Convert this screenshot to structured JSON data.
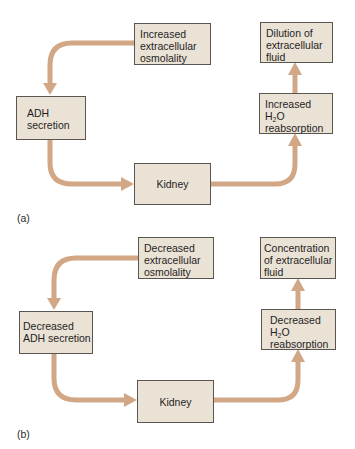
{
  "colors": {
    "box_fill": "#ebe2d6",
    "box_border": "#5a5550",
    "arrow": "#d2a786"
  },
  "panels": [
    {
      "label": "(a)",
      "stimulus": {
        "lines": [
          "Increased",
          "extracellular",
          "osmolality"
        ]
      },
      "hormone": {
        "lines": [
          "ADH",
          "secretion"
        ]
      },
      "organ": {
        "lines": [
          "Kidney"
        ]
      },
      "response": {
        "lines_pre": "Increased",
        "h2o_h": "H",
        "h2o_sub": "2",
        "h2o_o": "O",
        "lines_post": "reabsorption"
      },
      "outcome": {
        "lines": [
          "Dilution of",
          "extracellular",
          "fluid"
        ]
      }
    },
    {
      "label": "(b)",
      "stimulus": {
        "lines": [
          "Decreased",
          "extracellular",
          "osmolality"
        ]
      },
      "hormone": {
        "lines": [
          "Decreased",
          "ADH secretion"
        ]
      },
      "organ": {
        "lines": [
          "Kidney"
        ]
      },
      "response": {
        "lines_pre": "Decreased",
        "h2o_h": "H",
        "h2o_sub": "2",
        "h2o_o": "O",
        "lines_post": "reabsorption"
      },
      "outcome": {
        "lines": [
          "Concentration",
          "of extracellular",
          "fluid"
        ]
      }
    }
  ]
}
